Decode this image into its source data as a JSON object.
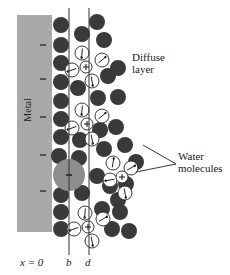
{
  "figure": {
    "colors": {
      "metal": "#a9a9a9",
      "metal_charge": "#222222",
      "solvent_dark": "#3a3a3a",
      "adsorbed_anion": "#8e8e8e",
      "water_fill": "#ffffff",
      "stroke": "#222222",
      "plane_line": "#333333"
    },
    "metal": {
      "label": "Metal",
      "x": 17,
      "y": 15,
      "w": 35,
      "h": 217,
      "charges": [
        "−",
        "−",
        "−",
        "−",
        "−"
      ],
      "charge_y": [
        45,
        79,
        117,
        155,
        191
      ]
    },
    "planes": [
      {
        "name": "b",
        "x": 69,
        "label": "b"
      },
      {
        "name": "d",
        "x": 89,
        "label": "d"
      }
    ],
    "axis_labels": {
      "origin": "x = 0",
      "inner_plane": "b",
      "outer_plane": "d"
    },
    "annotations": {
      "diffuse_layer_line1": "Diffuse",
      "diffuse_layer_line2": "layer",
      "water_molecules_line1": "Water",
      "water_molecules_line2": "molecules"
    },
    "adsorbed_anion": {
      "cx": 69,
      "cy": 175,
      "r": 16,
      "sign": "−"
    },
    "dark_circles": [
      [
        61,
        25
      ],
      [
        61,
        45
      ],
      [
        61,
        63
      ],
      [
        61,
        82
      ],
      [
        61,
        101
      ],
      [
        61,
        119
      ],
      [
        61,
        137
      ],
      [
        59,
        156
      ],
      [
        61,
        195
      ],
      [
        61,
        212
      ],
      [
        61,
        229
      ],
      [
        82,
        34
      ],
      [
        78,
        88
      ],
      [
        80,
        140
      ],
      [
        79,
        158
      ],
      [
        82,
        193
      ],
      [
        97,
        22
      ],
      [
        104,
        40
      ],
      [
        108,
        76
      ],
      [
        118,
        68
      ],
      [
        98,
        98
      ],
      [
        118,
        97
      ],
      [
        100,
        130
      ],
      [
        116,
        127
      ],
      [
        104,
        149
      ],
      [
        125,
        145
      ],
      [
        97,
        176
      ],
      [
        110,
        186
      ],
      [
        118,
        200
      ],
      [
        102,
        209
      ],
      [
        120,
        212
      ],
      [
        112,
        229
      ],
      [
        126,
        184
      ],
      [
        136,
        162
      ],
      [
        129,
        231
      ]
    ],
    "cations": [
      {
        "cx": 86,
        "cy": 67,
        "sign": "+"
      },
      {
        "cx": 87,
        "cy": 124,
        "sign": "+"
      },
      {
        "cx": 122,
        "cy": 177,
        "sign": "+"
      },
      {
        "cx": 88,
        "cy": 227,
        "sign": "+"
      }
    ],
    "water_dipoles": [
      {
        "cx": 82,
        "cy": 53,
        "angle": 95
      },
      {
        "cx": 102,
        "cy": 60,
        "angle": -40
      },
      {
        "cx": 72,
        "cy": 70,
        "angle": 160
      },
      {
        "cx": 92,
        "cy": 81,
        "angle": 80
      },
      {
        "cx": 82,
        "cy": 110,
        "angle": 95
      },
      {
        "cx": 102,
        "cy": 116,
        "angle": -40
      },
      {
        "cx": 72,
        "cy": 128,
        "angle": 160
      },
      {
        "cx": 92,
        "cy": 139,
        "angle": 80
      },
      {
        "cx": 113,
        "cy": 163,
        "angle": -80
      },
      {
        "cx": 131,
        "cy": 168,
        "angle": -30
      },
      {
        "cx": 110,
        "cy": 180,
        "angle": 170
      },
      {
        "cx": 125,
        "cy": 193,
        "angle": 80
      },
      {
        "cx": 85,
        "cy": 213,
        "angle": 95
      },
      {
        "cx": 103,
        "cy": 219,
        "angle": -30
      },
      {
        "cx": 74,
        "cy": 229,
        "angle": 160
      },
      {
        "cx": 92,
        "cy": 241,
        "angle": 80
      }
    ],
    "leader_lines": [
      {
        "x1": 176,
        "y1": 164,
        "x2": 143,
        "y2": 145
      },
      {
        "x1": 176,
        "y1": 164,
        "x2": 136,
        "y2": 172
      }
    ]
  }
}
